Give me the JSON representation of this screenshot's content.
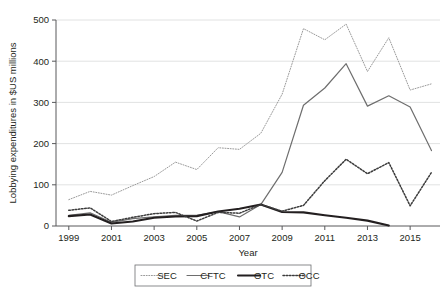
{
  "chart_data": {
    "type": "line",
    "title": "",
    "xlabel": "Year",
    "ylabel": "Lobbying expenditures in $US millions",
    "xlim": [
      1998.4,
      2016.4
    ],
    "ylim": [
      0,
      500
    ],
    "xticks": [
      1999,
      2001,
      2003,
      2005,
      2007,
      2009,
      2011,
      2013,
      2015
    ],
    "xtick_labels": [
      "1999",
      "2001",
      "2003",
      "2005",
      "2007",
      "2009",
      "2011",
      "2013",
      "2015"
    ],
    "yticks": [
      0,
      100,
      200,
      300,
      400,
      500
    ],
    "ytick_labels": [
      "0",
      "100",
      "200",
      "300",
      "400",
      "500"
    ],
    "grid": "horizontal",
    "legend_position": "below-axes",
    "x": [
      1999,
      2000,
      2001,
      2002,
      2003,
      2004,
      2005,
      2006,
      2007,
      2008,
      2009,
      2010,
      2011,
      2012,
      2013,
      2014,
      2015,
      2016
    ],
    "series": [
      {
        "name": "SEC",
        "style": "fine-dotted",
        "color": "#9a9a9a",
        "values": [
          64,
          84,
          75,
          98,
          120,
          155,
          137,
          190,
          186,
          225,
          320,
          479,
          452,
          490,
          375,
          457,
          330,
          345
        ]
      },
      {
        "name": "CFTC",
        "style": "solid-thin",
        "color": "#6e6e6e",
        "values": [
          26,
          32,
          9,
          18,
          22,
          26,
          26,
          35,
          22,
          52,
          130,
          293,
          335,
          394,
          291,
          316,
          289,
          183
        ]
      },
      {
        "name": "OTC",
        "style": "solid-thick",
        "color": "#231f20",
        "values": [
          24,
          28,
          6,
          11,
          20,
          23,
          24,
          35,
          42,
          52,
          34,
          33,
          26,
          20,
          13,
          1,
          null,
          null
        ]
      },
      {
        "name": "OCC",
        "style": "coarse-dotted",
        "color": "#3c3c3c",
        "values": [
          38,
          44,
          11,
          21,
          30,
          33,
          12,
          33,
          31,
          52,
          36,
          50,
          110,
          162,
          127,
          154,
          49,
          130
        ]
      }
    ]
  },
  "legend": {
    "items": [
      {
        "label": "SEC"
      },
      {
        "label": "CFTC"
      },
      {
        "label": "OTC"
      },
      {
        "label": "OCC"
      }
    ]
  }
}
